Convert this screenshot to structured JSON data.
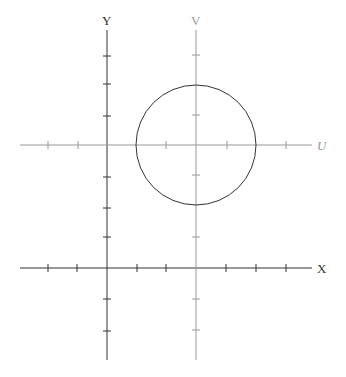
{
  "diagram": {
    "colors": {
      "xy_axes": "#333333",
      "uv_axes": "#999999",
      "circle": "#333333",
      "uv_label": "#999999",
      "xy_label": "#333333"
    },
    "xy_frame": {
      "x_label": "X",
      "y_label": "Y",
      "origin": [
        107,
        268
      ]
    },
    "uv_frame": {
      "u_label": "U",
      "v_label": "V",
      "origin": [
        196,
        145
      ]
    },
    "circle": {
      "center": [
        196,
        145
      ],
      "radius": 60,
      "frame": "UV"
    },
    "tick_spacing": 30
  }
}
